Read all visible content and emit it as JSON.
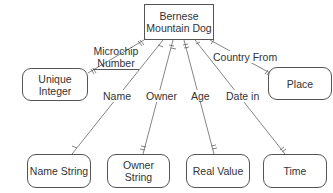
{
  "diagram": {
    "main_entity": {
      "label_line1": "Bernese",
      "label_line2": "Mountain Dog"
    },
    "attributes": [
      {
        "id": "unique-integer",
        "label_line1": "Unique",
        "label_line2": "Integer",
        "relation": "Microchip Number",
        "relation_line1": "Microchip",
        "relation_line2": "Number"
      },
      {
        "id": "name-string",
        "label": "Name String",
        "relation": "Name"
      },
      {
        "id": "owner-string",
        "label": "Owner String",
        "relation": "Owner"
      },
      {
        "id": "real-value",
        "label": "Real Value",
        "relation": "Age"
      },
      {
        "id": "time",
        "label": "Time",
        "relation": "Date in"
      },
      {
        "id": "place",
        "label": "Place",
        "relation": "Country From"
      }
    ],
    "colors": {
      "line": "#666666",
      "border": "#555555",
      "text": "#333333",
      "background": "#ffffff"
    }
  }
}
